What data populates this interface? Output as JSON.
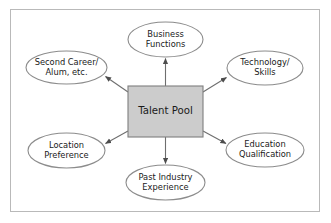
{
  "diagram": {
    "type": "hub-and-spoke",
    "center": {
      "label": "Talent Pool",
      "shape": "rectangle",
      "fill": "#cccccc",
      "stroke": "#808080",
      "x": 128,
      "y": 86,
      "width": 75,
      "height": 51
    },
    "frame": {
      "stroke": "#b9b9b9",
      "fill": "#ffffff"
    },
    "oval_style": {
      "fill": "#ffffff",
      "stroke": "#8c8c8c"
    },
    "arrow_style": {
      "stroke": "#6e6e6e",
      "direction": "center-to-node"
    },
    "nodes": [
      {
        "id": "business-functions",
        "label": "Business Functions",
        "line1": "Business",
        "line2": "Functions",
        "cx": 165.5,
        "cy": 39.5,
        "rx": 37.5,
        "ry": 17.5
      },
      {
        "id": "second-career-alum",
        "label": "Second Career/ Alum, etc.",
        "line1": "Second Career/",
        "line2": "Alum, etc.",
        "cx": 66.5,
        "cy": 67.5,
        "rx": 40.5,
        "ry": 16.5
      },
      {
        "id": "technology-skills",
        "label": "Technology/ Skills",
        "line1": "Technology/",
        "line2": "Skills",
        "cx": 265.0,
        "cy": 68.0,
        "rx": 38.0,
        "ry": 17.0
      },
      {
        "id": "location-preference",
        "label": "Location Preference",
        "line1": "Location",
        "line2": "Preference",
        "cx": 66.5,
        "cy": 150.5,
        "rx": 38.5,
        "ry": 17.5
      },
      {
        "id": "education-qualification",
        "label": "Education Qualification",
        "line1": "Education",
        "line2": "Qualification",
        "cx": 265.0,
        "cy": 150.0,
        "rx": 39.0,
        "ry": 17.0
      },
      {
        "id": "past-industry-experience",
        "label": "Past Industry Experience",
        "line1": "Past Industry",
        "line2": "Experience",
        "cx": 165.5,
        "cy": 182.5,
        "rx": 39.5,
        "ry": 17.5
      }
    ],
    "edges": [
      {
        "id": "edge-business-functions",
        "from": "center",
        "to": "business-functions"
      },
      {
        "id": "edge-second-career-alum",
        "from": "center",
        "to": "second-career-alum"
      },
      {
        "id": "edge-technology-skills",
        "from": "center",
        "to": "technology-skills"
      },
      {
        "id": "edge-location-preference",
        "from": "center",
        "to": "location-preference"
      },
      {
        "id": "edge-education-qualification",
        "from": "center",
        "to": "education-qualification"
      },
      {
        "id": "edge-past-industry-experience",
        "from": "center",
        "to": "past-industry-experience"
      }
    ]
  }
}
